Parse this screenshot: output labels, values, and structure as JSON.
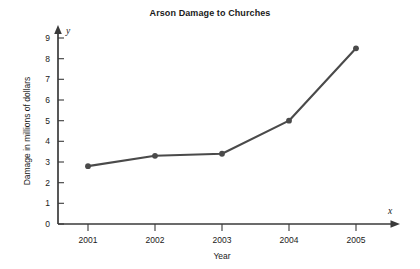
{
  "chart_data": {
    "type": "line",
    "title": "Arson Damage to Churches",
    "xlabel": "Year",
    "ylabel": "Damage in millions of dollars",
    "x_axis_symbol": "x",
    "y_axis_symbol": "y",
    "categories": [
      "2001",
      "2002",
      "2003",
      "2004",
      "2005"
    ],
    "values": [
      2.8,
      3.3,
      3.4,
      5.0,
      8.5
    ],
    "ylim": [
      0,
      9
    ],
    "y_ticks": [
      "0",
      "1",
      "2",
      "3",
      "4",
      "5",
      "6",
      "7",
      "8",
      "9"
    ],
    "x_ticks": [
      "2001",
      "2002",
      "2003",
      "2004",
      "2005"
    ],
    "grid": false,
    "legend": false,
    "series_color": "#4a4a4a",
    "axis_color": "#3a3a3a",
    "marker": "circle"
  }
}
